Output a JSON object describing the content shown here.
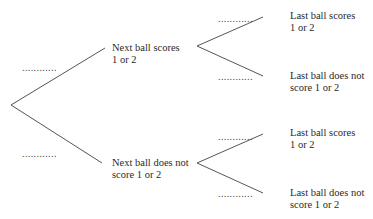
{
  "diagram": {
    "type": "probability-tree",
    "line_color": "#555555",
    "blank_placeholder": "............",
    "first_level": [
      {
        "label_line1": "Next ball scores",
        "label_line2": "1 or 2",
        "probability": "............",
        "children": [
          {
            "label_line1": "Last ball scores",
            "label_line2": "1 or 2",
            "probability": "............"
          },
          {
            "label_line1": "Last ball does not",
            "label_line2": "score 1 or 2",
            "probability": "............"
          }
        ]
      },
      {
        "label_line1": "Next ball does not",
        "label_line2": "score 1 or 2",
        "probability": "............",
        "children": [
          {
            "label_line1": "Last ball scores",
            "label_line2": "1 or 2",
            "probability": "............"
          },
          {
            "label_line1": "Last ball does not",
            "label_line2": "score 1 or 2",
            "probability": "............"
          }
        ]
      }
    ]
  }
}
